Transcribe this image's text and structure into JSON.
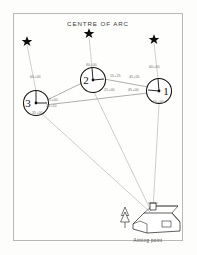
{
  "diagram": {
    "title": "CENTRE OF ARC",
    "caption": "Aiming point",
    "guns": [
      {
        "id": "gun-3",
        "label": "3",
        "cx": 36,
        "cy": 103,
        "r": 12.5
      },
      {
        "id": "gun-2",
        "label": "2",
        "cx": 93,
        "cy": 80,
        "r": 12.5
      },
      {
        "id": "gun-1",
        "label": "1",
        "cx": 159,
        "cy": 91,
        "r": 12.5
      }
    ],
    "stars": [
      {
        "id": "star-left",
        "x": 27,
        "y": 41
      },
      {
        "id": "star-centre",
        "x": 89,
        "y": 33
      },
      {
        "id": "star-right",
        "x": 154,
        "y": 39
      }
    ],
    "aiming_point": {
      "x": 152,
      "y": 213
    },
    "annotations": [
      {
        "id": "ann-gun3-coa",
        "text": "60+00",
        "x": 30,
        "y": 78
      },
      {
        "id": "ann-gun2-coa",
        "text": "60+00",
        "x": 86,
        "y": 66
      },
      {
        "id": "ann-gun1-coa",
        "text": "60+00",
        "x": 149,
        "y": 68
      },
      {
        "id": "ann-gun3-gun2",
        "text": "15+00",
        "x": 47,
        "y": 101
      },
      {
        "id": "ann-gun3-aim",
        "text": "20+10",
        "x": 46,
        "y": 107
      },
      {
        "id": "ann-gun3-below",
        "text": "35+00",
        "x": 32,
        "y": 114
      },
      {
        "id": "ann-gun2-right-a",
        "text": "15+25",
        "x": 110,
        "y": 77
      },
      {
        "id": "ann-gun2-right-b",
        "text": "25+00",
        "x": 104,
        "y": 91
      },
      {
        "id": "ann-gun1-left-a",
        "text": "45+05",
        "x": 129,
        "y": 78
      },
      {
        "id": "ann-gun1-left-b",
        "text": "45+00",
        "x": 128,
        "y": 91
      },
      {
        "id": "ann-gun1-below",
        "text": "60+00",
        "x": 153,
        "y": 103
      }
    ],
    "colors": {
      "ink": "#101010",
      "ray": "#a9a9a4",
      "annotation": "#6f6f6f",
      "frame": "#b9b9b4",
      "paper": "#fdfdfc"
    }
  }
}
